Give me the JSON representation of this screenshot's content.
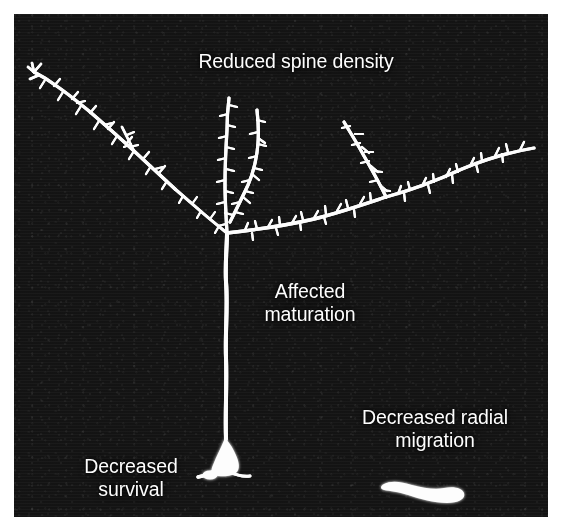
{
  "figure": {
    "kind": "fluorescence micrograph of a labeled cortical pyramidal neuron with annotation callouts",
    "panel": {
      "background_color": "#0a0a0a",
      "structure_color": "#ffffff",
      "border_color": "#ffffff"
    },
    "labels": [
      {
        "id": "reduced-spine-density",
        "text": "Reduced spine density",
        "points_at": "apical and basal dendritic spines",
        "color": "#fdfdfd"
      },
      {
        "id": "affected-maturation",
        "text": "Affected\nmaturation",
        "points_at": "apical trunk / dendritic arbor",
        "color": "#fdfdfd"
      },
      {
        "id": "decreased-survival",
        "text": "Decreased\nsurvival",
        "points_at": "neuronal soma",
        "color": "#fdfdfd"
      },
      {
        "id": "decreased-radial-migration",
        "text": "Decreased radial\nmigration",
        "points_at": "undermigrated bipolar cell at bottom right",
        "color": "#fdfdfd"
      }
    ],
    "structures": [
      {
        "id": "soma",
        "description": "pear-shaped cell body, lower centre"
      },
      {
        "id": "apical-trunk",
        "description": "long vertical apical dendrite rising from the soma"
      },
      {
        "id": "apical-tuft",
        "description": "spiny branches fanning left, centre and right from the main bifurcation"
      },
      {
        "id": "basal-process",
        "description": "short process below the soma"
      },
      {
        "id": "migrated-cell",
        "description": "small elongated bipolar cell, bottom right"
      }
    ]
  }
}
